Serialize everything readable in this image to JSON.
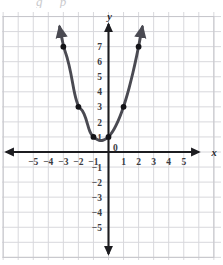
{
  "figure": {
    "top_remnant_text": "g p",
    "background_color": "#ffffff",
    "grid_color": "#d8d8dc",
    "grid_major_color": "#c6c6cb",
    "axis_color": "#1c1c20",
    "curve_color": "#4a4a52",
    "point_color": "#141418"
  },
  "axes": {
    "x_axis_label": "x",
    "y_axis_label": "y",
    "origin_label": "0",
    "x_ticks": [
      "-5",
      "-4",
      "-3",
      "-2",
      "-1",
      "1",
      "2",
      "3",
      "4",
      "5"
    ],
    "y_ticks": [
      "7",
      "6",
      "5",
      "4",
      "3",
      "2",
      "1",
      "-1",
      "-2",
      "-3",
      "-4",
      "-5"
    ]
  },
  "chart_data": {
    "type": "line",
    "title": "",
    "xlabel": "x",
    "ylabel": "y",
    "xlim": [
      -6.2,
      6.6
    ],
    "ylim": [
      -6.1,
      7.9
    ],
    "grid": true,
    "legend": null,
    "x_tick_values": [
      -5,
      -4,
      -3,
      -2,
      -1,
      0,
      1,
      2,
      3,
      4,
      5
    ],
    "y_tick_values": [
      -5,
      -4,
      -3,
      -2,
      -1,
      1,
      2,
      3,
      4,
      5,
      6,
      7
    ],
    "series": [
      {
        "name": "parabola",
        "equation": "y = x^2 + x + 1",
        "vertex": [
          -0.5,
          0.75
        ],
        "color": "#4a4a52",
        "arrows": "both",
        "marked_points": [
          {
            "x": -3,
            "y": 7
          },
          {
            "x": -2,
            "y": 3
          },
          {
            "x": -1,
            "y": 1
          },
          {
            "x": 0,
            "y": 1
          },
          {
            "x": 1,
            "y": 3
          },
          {
            "x": 2,
            "y": 7
          }
        ],
        "x": [
          -3.25,
          -3,
          -2.75,
          -2.5,
          -2.25,
          -2,
          -1.75,
          -1.5,
          -1.25,
          -1,
          -0.75,
          -0.5,
          -0.25,
          0,
          0.25,
          0.5,
          0.75,
          1,
          1.25,
          1.5,
          1.75,
          2,
          2.25
        ],
        "values": [
          8.31,
          7,
          6.31,
          5.25,
          3.81,
          3,
          2.81,
          2.25,
          1.31,
          1,
          0.81,
          0.75,
          0.81,
          1,
          1.31,
          1.75,
          2.31,
          3,
          3.81,
          4.75,
          5.81,
          7,
          8.31
        ]
      }
    ]
  }
}
